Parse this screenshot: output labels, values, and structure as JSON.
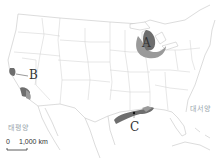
{
  "map": {
    "regions": [
      {
        "id": "A",
        "label": "A",
        "description": "Great Lakes region (Detroit area)"
      },
      {
        "id": "B",
        "label": "B",
        "description": "California (San Francisco / Los Angeles)"
      },
      {
        "id": "C",
        "label": "C",
        "description": "Gulf Coast (Houston / New Orleans)"
      }
    ],
    "oceans": {
      "pacific": "태평양",
      "atlantic": "대서양"
    },
    "scale": {
      "zero": "0",
      "distance": "1,000 km"
    },
    "colors": {
      "land_border": "#b8b8b8",
      "region_dark": "#6e6e6e",
      "region_light": "#9a9a9a",
      "ocean_label": "#9aa6ad"
    }
  }
}
